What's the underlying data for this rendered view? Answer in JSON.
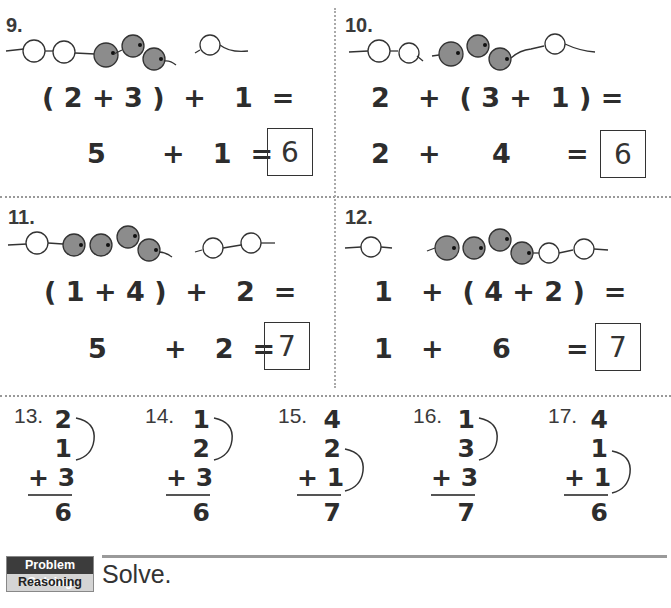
{
  "problems": {
    "p9": {
      "number": "9.",
      "beads": "2 white, 3 gray | 1 white",
      "line1": "( 2 + 3 )  +   1  =",
      "line2_a": "5",
      "line2_b": "+   1  =",
      "answer": "6"
    },
    "p10": {
      "number": "10.",
      "beads": "2 white | 3 gray, 1 white",
      "line1": "2   +  ( 3 +  1 ) =",
      "line2_a": "2   +",
      "line2_b": "4",
      "line2_c": "=",
      "answer": "6"
    },
    "p11": {
      "number": "11.",
      "beads": "1 white, 4 gray | 2 white",
      "line1": "( 1 + 4 )  +   2  =",
      "line2_a": "5",
      "line2_b": "+   2  =",
      "answer": "7"
    },
    "p12": {
      "number": "12.",
      "beads": "1 white | 4 gray, 2 white",
      "line1": "1   +  ( 4 + 2 )  =",
      "line2_a": "1   +",
      "line2_b": "6",
      "line2_c": "=",
      "answer": "7"
    }
  },
  "vertical": [
    {
      "number": "13.",
      "a": "2",
      "b": "1",
      "c": "+ 3",
      "sum": "6",
      "bracket": "top"
    },
    {
      "number": "14.",
      "a": "1",
      "b": "2",
      "c": "+ 3",
      "sum": "6",
      "bracket": "top"
    },
    {
      "number": "15.",
      "a": "4",
      "b": "2",
      "c": "+ 1",
      "sum": "7",
      "bracket": "bottom"
    },
    {
      "number": "16.",
      "a": "1",
      "b": "3",
      "c": "+ 3",
      "sum": "7",
      "bracket": "top"
    },
    {
      "number": "17.",
      "a": "4",
      "b": "1",
      "c": "+ 1",
      "sum": "6",
      "bracket": "bottom"
    }
  ],
  "footer": {
    "badge_top": "Problem Solving",
    "badge_bottom": "Reasoning",
    "instruction": "Solve."
  },
  "colors": {
    "bead_gray": "#8c8c8c",
    "bead_white": "#ffffff",
    "badge_dark": "#3c3c3c",
    "badge_light": "#d4d4d4"
  }
}
